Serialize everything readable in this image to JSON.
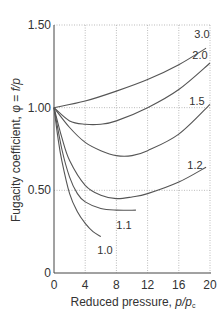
{
  "chart_data": {
    "type": "line",
    "title": "",
    "xlabel": "Reduced pressure, p/p_c",
    "ylabel": "Fugacity coefficient, φ = f/p",
    "xlim": [
      0,
      20
    ],
    "ylim": [
      0,
      1.5
    ],
    "x_ticks": [
      "0",
      "4",
      "8",
      "12",
      "16",
      "20"
    ],
    "y_ticks": [
      "0",
      "0.50",
      "1.00",
      "1.50"
    ],
    "grid": true,
    "legend_position": "inline curve labels",
    "series": [
      {
        "name": "3.0",
        "x": [
          0,
          4,
          8,
          12,
          16,
          19.5
        ],
        "values": [
          1.0,
          1.04,
          1.1,
          1.17,
          1.26,
          1.36
        ]
      },
      {
        "name": "2.0",
        "x": [
          0,
          2,
          4,
          6,
          8,
          12,
          16,
          20
        ],
        "values": [
          1.0,
          0.92,
          0.9,
          0.9,
          0.92,
          1.0,
          1.11,
          1.27
        ]
      },
      {
        "name": "1.5",
        "x": [
          0,
          2,
          4,
          6,
          8,
          10,
          12,
          16,
          20
        ],
        "values": [
          1.0,
          0.88,
          0.79,
          0.74,
          0.71,
          0.71,
          0.74,
          0.84,
          1.02
        ]
      },
      {
        "name": "1.2",
        "x": [
          0,
          1,
          2,
          4,
          6,
          8,
          10,
          12,
          16,
          19.5
        ],
        "values": [
          1.0,
          0.82,
          0.68,
          0.53,
          0.47,
          0.45,
          0.46,
          0.48,
          0.55,
          0.64
        ]
      },
      {
        "name": "1.1",
        "x": [
          0,
          1,
          2,
          3,
          4,
          6,
          8,
          10.5
        ],
        "values": [
          1.0,
          0.75,
          0.58,
          0.48,
          0.43,
          0.39,
          0.38,
          0.38
        ]
      },
      {
        "name": "1.0",
        "x": [
          0,
          0.5,
          1,
          2,
          3,
          4,
          5,
          6
        ],
        "values": [
          1.0,
          0.82,
          0.68,
          0.48,
          0.37,
          0.3,
          0.25,
          0.22
        ]
      }
    ],
    "curve_labels": [
      "3.0",
      "2.0",
      "1.5",
      "1.2",
      "1.1",
      "1.0"
    ],
    "annotations": "Curve labels denote reduced temperature T/T_c"
  },
  "axes": {
    "x_title": "Reduced pressure, ",
    "x_title_var": "p/p",
    "x_title_sub": "c",
    "y_title": "Fugacity coefficient,  φ = ",
    "y_title_var": "f/p"
  }
}
